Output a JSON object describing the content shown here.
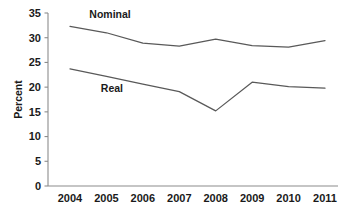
{
  "chart_data": {
    "type": "line",
    "title": "",
    "subtitle": "",
    "xlabel": "",
    "ylabel": "Percent",
    "categories": [
      "2004",
      "2005",
      "2006",
      "2007",
      "2008",
      "2009",
      "2010",
      "2011"
    ],
    "x": [
      2004,
      2005,
      2006,
      2007,
      2008,
      2009,
      2010,
      2011
    ],
    "xlim": [
      2004,
      2011
    ],
    "ylim": [
      0,
      35
    ],
    "y_ticks": [
      0,
      5,
      10,
      15,
      20,
      25,
      30,
      35
    ],
    "y_tick_labels": [
      "0",
      "5",
      "10",
      "15",
      "20",
      "25",
      "30",
      "35"
    ],
    "x_tick_labels": [
      "2004",
      "2005",
      "2006",
      "2007",
      "2008",
      "2009",
      "2010",
      "2011"
    ],
    "grid": false,
    "legend_position": "inline-annotation",
    "series": [
      {
        "name": "Nominal",
        "label": "Nominal",
        "color": "#595959",
        "values": [
          32.3,
          31.0,
          28.9,
          28.3,
          29.7,
          28.4,
          28.1,
          29.4
        ]
      },
      {
        "name": "Real",
        "label": "Real",
        "color": "#595959",
        "values": [
          23.7,
          22.2,
          20.6,
          19.1,
          15.2,
          21.0,
          20.1,
          19.8
        ]
      }
    ],
    "annotations": [
      {
        "text": "Nominal",
        "series": "Nominal",
        "x": 2005.1,
        "y": 33.9
      },
      {
        "text": "Real",
        "series": "Real",
        "x": 2005.15,
        "y": 19.1
      }
    ]
  },
  "axes": {
    "y_axis_title": "Percent"
  }
}
